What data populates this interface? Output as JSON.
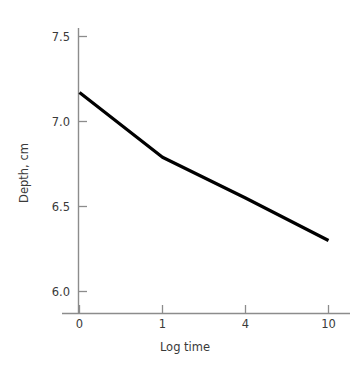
{
  "chart_data": {
    "type": "line",
    "title": "",
    "xlabel": "Log time",
    "ylabel": "Depth, cm",
    "x_tick_labels": [
      "0",
      "1",
      "4",
      "10"
    ],
    "y_tick_labels": [
      "6.0",
      "6.5",
      "7.0",
      "7.5"
    ],
    "x_categories": [
      0,
      1,
      4,
      10
    ],
    "ylim": [
      5.85,
      7.65
    ],
    "grid": false,
    "legend": null,
    "series": [
      {
        "name": "Depth vs log time",
        "x": [
          0,
          1,
          4,
          10
        ],
        "values": [
          7.17,
          6.79,
          6.55,
          6.3
        ]
      }
    ]
  },
  "axes": {
    "y_title": "Depth, cm",
    "x_title": "Log time",
    "y_ticks": [
      {
        "label": "7.5",
        "value": 7.5
      },
      {
        "label": "7.0",
        "value": 7.0
      },
      {
        "label": "6.5",
        "value": 6.5
      },
      {
        "label": "6.0",
        "value": 6.0
      }
    ],
    "x_ticks": [
      {
        "label": "0",
        "value": 0
      },
      {
        "label": "1",
        "value": 1
      },
      {
        "label": "4",
        "value": 4
      },
      {
        "label": "10",
        "value": 10
      }
    ]
  },
  "style": {
    "line_color": "#000000",
    "axis_color": "#8c8c8c",
    "text_color": "#3a3a3a",
    "background": "#ffffff"
  }
}
